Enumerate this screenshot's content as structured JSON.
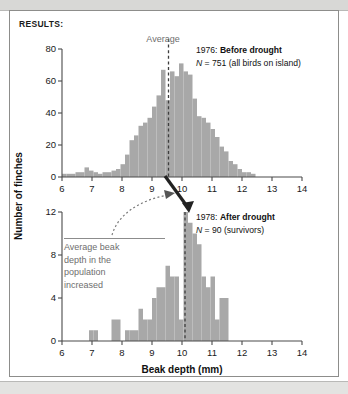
{
  "figure": {
    "results_label": "RESULTS:",
    "x_axis_title": "Beak depth (mm)",
    "y_axis_title": "Number of finches",
    "average_label": "Average",
    "callout": {
      "lines": [
        "Average beak",
        "depth in the",
        "population",
        "increased"
      ]
    },
    "colors": {
      "bar": "#a8a8a8",
      "axis": "#4a4a4a",
      "average_line": "#3d3d3d",
      "callout_text": "#6e6e6e",
      "frame": "#8d8d8b"
    }
  },
  "panels": [
    {
      "id": "before-drought",
      "year": "1976:",
      "condition": "Before drought",
      "n_text": "N",
      "n_value": " = 751 (all birds on island)",
      "average": 9.55
    },
    {
      "id": "after-drought",
      "year": "1978:",
      "condition": "After drought",
      "n_text": "N",
      "n_value": " = 90 (survivors)",
      "average": 10.1
    }
  ],
  "chart_data": [
    {
      "type": "bar",
      "id": "before-drought-histogram",
      "title": "1976: Before drought",
      "subtitle": "N = 751 (all birds on island)",
      "xlabel": "Beak depth (mm)",
      "ylabel": "Number of finches",
      "xlim": [
        6,
        14
      ],
      "ylim": [
        0,
        80
      ],
      "xticks": [
        6,
        7,
        8,
        9,
        10,
        11,
        12,
        13,
        14
      ],
      "yticks": [
        0,
        20,
        40,
        60,
        80
      ],
      "bin_width": 0.15,
      "grid": false,
      "legend": "none",
      "annotations": [
        {
          "text": "Average",
          "x": 9.55,
          "type": "vline-label"
        }
      ],
      "bins": [
        6.0,
        6.15,
        6.3,
        6.45,
        6.6,
        6.75,
        6.9,
        7.05,
        7.2,
        7.35,
        7.5,
        7.65,
        7.8,
        7.95,
        8.1,
        8.25,
        8.4,
        8.55,
        8.7,
        8.85,
        9.0,
        9.15,
        9.3,
        9.45,
        9.6,
        9.75,
        9.9,
        10.05,
        10.2,
        10.35,
        10.5,
        10.65,
        10.8,
        10.95,
        11.1,
        11.25,
        11.4,
        11.55,
        11.7,
        11.85,
        12.0,
        12.15,
        12.3
      ],
      "values": [
        2,
        2,
        2,
        3,
        3,
        6,
        4,
        3,
        2,
        3,
        3,
        4,
        5,
        8,
        14,
        23,
        26,
        32,
        34,
        37,
        44,
        51,
        67,
        48,
        66,
        63,
        71,
        66,
        64,
        49,
        38,
        37,
        34,
        30,
        25,
        19,
        16,
        10,
        8,
        5,
        3,
        3,
        2
      ]
    },
    {
      "type": "bar",
      "id": "after-drought-histogram",
      "title": "1978: After drought",
      "subtitle": "N = 90 (survivors)",
      "xlabel": "Beak depth (mm)",
      "ylabel": "Number of finches",
      "xlim": [
        6,
        14
      ],
      "ylim": [
        0,
        12
      ],
      "xticks": [
        6,
        7,
        8,
        9,
        10,
        11,
        12,
        13,
        14
      ],
      "yticks": [
        0,
        4,
        8,
        12
      ],
      "bin_width": 0.15,
      "grid": false,
      "legend": "none",
      "annotations": [
        {
          "text": "Average beak depth in the population increased",
          "x": 10.1,
          "type": "callout"
        }
      ],
      "bins": [
        6.9,
        7.05,
        7.65,
        7.8,
        8.1,
        8.25,
        8.4,
        8.55,
        8.7,
        8.85,
        9.0,
        9.15,
        9.3,
        9.45,
        9.6,
        9.75,
        9.9,
        10.05,
        10.2,
        10.35,
        10.5,
        10.65,
        10.8,
        10.95,
        11.1,
        11.25,
        11.4
      ],
      "values": [
        1,
        1,
        2,
        2,
        1,
        1,
        1,
        3,
        2,
        2,
        4,
        5,
        5,
        7,
        6,
        6,
        2,
        12,
        11,
        10,
        9,
        6,
        5,
        6,
        2,
        4,
        4
      ]
    }
  ]
}
